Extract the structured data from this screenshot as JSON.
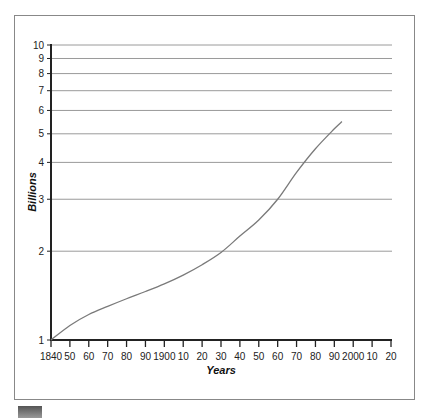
{
  "chart_data": {
    "type": "line",
    "title": "",
    "xlabel": "Years",
    "ylabel": "Billions",
    "yscale": "log",
    "ylim": [
      1,
      10
    ],
    "xlim": [
      1840,
      2020
    ],
    "grid": "horizontal",
    "y_ticks": [
      1,
      2,
      3,
      4,
      5,
      6,
      7,
      8,
      9,
      10
    ],
    "x_tick_labels": [
      "1840",
      "50",
      "60",
      "70",
      "80",
      "90",
      "1900",
      "10",
      "20",
      "30",
      "40",
      "50",
      "60",
      "70",
      "80",
      "90",
      "2000",
      "10",
      "20"
    ],
    "x_tick_values": [
      1840,
      1850,
      1860,
      1870,
      1880,
      1890,
      1900,
      1910,
      1920,
      1930,
      1940,
      1950,
      1960,
      1970,
      1980,
      1990,
      2000,
      2010,
      2020
    ],
    "series": [
      {
        "name": "World population",
        "x": [
          1840,
          1850,
          1860,
          1870,
          1880,
          1890,
          1900,
          1910,
          1920,
          1930,
          1940,
          1950,
          1960,
          1970,
          1980,
          1990,
          1994
        ],
        "values": [
          1.0,
          1.12,
          1.22,
          1.3,
          1.38,
          1.46,
          1.55,
          1.66,
          1.8,
          1.98,
          2.25,
          2.55,
          3.0,
          3.7,
          4.45,
          5.2,
          5.5
        ]
      }
    ]
  },
  "colors": {
    "line": "#7a7a7a",
    "grid": "#9a9a9a",
    "axis": "#222222",
    "frame": "#888888"
  }
}
